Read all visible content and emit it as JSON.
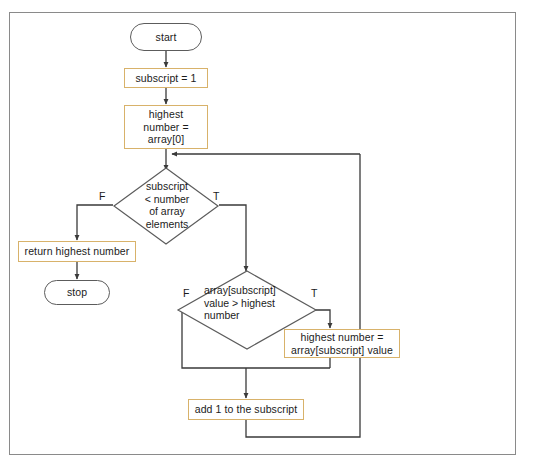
{
  "figure": {
    "type": "flowchart",
    "border_color": "#8a8a8a",
    "process_border_color": "#d8b26a",
    "terminal_border_color": "#5c5c5c",
    "connector_color": "#3a3a3a"
  },
  "nodes": {
    "start": {
      "label": "start",
      "shape": "terminal"
    },
    "init_subscript": {
      "label": "subscript = 1",
      "shape": "process"
    },
    "init_highest": {
      "label": "highest\nnumber =\narray[0]",
      "shape": "process"
    },
    "decision_loop": {
      "label": "subscript\n< number\nof array\nelements",
      "shape": "decision"
    },
    "return_highest": {
      "label": "return highest number",
      "shape": "process"
    },
    "stop": {
      "label": "stop",
      "shape": "terminal"
    },
    "decision_compare": {
      "label": "array[subscript]\nvalue > highest\nnumber",
      "shape": "decision"
    },
    "assign_highest": {
      "label": "highest number =\narray[subscript] value",
      "shape": "process"
    },
    "increment": {
      "label": "add 1 to the subscript",
      "shape": "process"
    }
  },
  "branch_labels": {
    "loop_false": "F",
    "loop_true": "T",
    "compare_false": "F",
    "compare_true": "T"
  }
}
